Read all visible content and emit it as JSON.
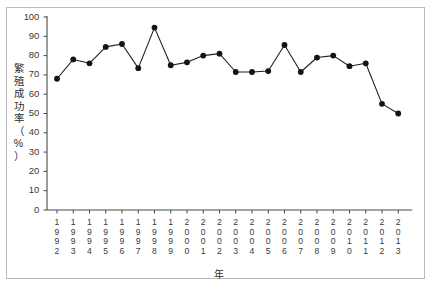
{
  "chart_data": {
    "type": "line",
    "title": "",
    "xlabel": "年",
    "ylabel": "繁殖成功率（%）",
    "ylabel_chars": [
      "繁",
      "殖",
      "成",
      "功",
      "率",
      "（",
      "%",
      "）"
    ],
    "ylim": [
      0,
      100
    ],
    "yticks": [
      0,
      10,
      20,
      30,
      40,
      50,
      60,
      70,
      80,
      90,
      100
    ],
    "ytick_labels": [
      "0",
      "10",
      "20",
      "30",
      "40",
      "50",
      "60",
      "70",
      "80",
      "90",
      "100"
    ],
    "grid": false,
    "legend": "none",
    "marker": "filled-circle",
    "line_color": "#231f20",
    "marker_color": "#141414",
    "categories": [
      "1992",
      "1993",
      "1994",
      "1995",
      "1996",
      "1997",
      "1998",
      "1999",
      "2000",
      "2001",
      "2002",
      "2003",
      "2004",
      "2005",
      "2006",
      "2007",
      "2008",
      "2009",
      "2010",
      "2011",
      "2012",
      "2013"
    ],
    "values": [
      68,
      78,
      76,
      84.5,
      86,
      73.5,
      94.5,
      75,
      76.5,
      80,
      81,
      71.5,
      71.5,
      72,
      85.5,
      71.5,
      79,
      80,
      74.5,
      76,
      55,
      50
    ]
  }
}
